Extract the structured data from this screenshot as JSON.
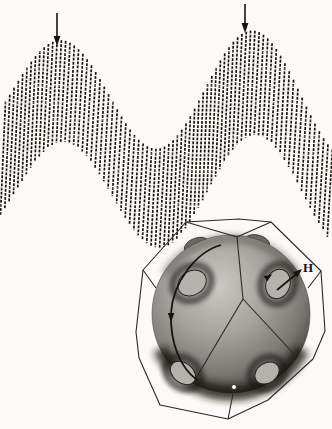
{
  "colors": {
    "background": "#fbfaf7",
    "ink": "#17130e",
    "wire": "#2b2926",
    "orbit": "#151310",
    "ball_core": "#cbc9c4",
    "ball_mid": "#9a9893",
    "ball_outer": "#4a4844",
    "ball_rim": "#17150f",
    "neck_fill": "#b4b2ad",
    "neck_halo": "#1b1916",
    "bump_fill": "#6e6c67"
  },
  "waveform": {
    "x_start": 3,
    "x_end": 330,
    "stroke_spacing": 4.3,
    "stroke_lean": 5,
    "stroke_width": 1.7,
    "dash": "2.8 1.3",
    "top_envelope": {
      "base": 92,
      "amp0": 49,
      "amp_slope": 0.05,
      "phase_x": 57,
      "period": 192
    },
    "bottom_envelope": {
      "base": 193,
      "amp0": 49,
      "amp_slope": 0.035,
      "phase_x": 65,
      "period": 192
    },
    "beat_peaks": [
      {
        "x": 57,
        "top_y": 43
      },
      {
        "x": 245,
        "top_y": 32
      }
    ],
    "beat_trough": {
      "x": 150,
      "top_y": 146
    },
    "marker_arrows": [
      {
        "x": 57,
        "y1": 13,
        "y2": 41
      },
      {
        "x": 245,
        "y1": 4,
        "y2": 28
      }
    ],
    "raster_lines": {
      "y_start": 52,
      "y_step": 17,
      "count": 10,
      "opacity": 0.45
    }
  },
  "brillouin_zone": {
    "outline": [
      [
        186,
        222
      ],
      [
        239,
        219
      ],
      [
        271,
        222
      ],
      [
        321,
        271
      ],
      [
        325,
        331
      ],
      [
        313,
        359
      ],
      [
        268,
        400
      ],
      [
        228,
        419
      ],
      [
        160,
        405
      ],
      [
        139,
        358
      ],
      [
        136,
        332
      ],
      [
        143,
        270
      ]
    ],
    "front_edges": [
      [
        [
          186,
          222
        ],
        [
          237,
          237
        ]
      ],
      [
        [
          237,
          237
        ],
        [
          271,
          222
        ]
      ],
      [
        [
          237,
          237
        ],
        [
          243,
          299
        ]
      ],
      [
        [
          243,
          299
        ],
        [
          196,
          378
        ]
      ],
      [
        [
          243,
          299
        ],
        [
          293,
          353
        ]
      ],
      [
        [
          143,
          270
        ],
        [
          156,
          288
        ]
      ],
      [
        [
          321,
          271
        ],
        [
          308,
          288
        ]
      ],
      [
        [
          234,
          389
        ],
        [
          228,
          419
        ]
      ]
    ],
    "vertex_marker": {
      "cx": 234,
      "cy": 387,
      "r": 2.5
    }
  },
  "fermi_surface": {
    "ball": {
      "cx": 231,
      "cy": 314,
      "r": 79
    },
    "necks": [
      {
        "cx": 192,
        "cy": 283,
        "rx": 15,
        "ry": 12,
        "rot": -32
      },
      {
        "cx": 278,
        "cy": 284,
        "rx": 12,
        "ry": 15,
        "rot": 18
      },
      {
        "cx": 183,
        "cy": 373,
        "rx": 14,
        "ry": 10,
        "rot": 38
      },
      {
        "cx": 267,
        "cy": 373,
        "rx": 13,
        "ry": 10,
        "rot": -35
      }
    ],
    "silhouette_bumps": [
      {
        "cx": 197,
        "cy": 246,
        "rx": 13,
        "ry": 8,
        "rot": -18
      },
      {
        "cx": 257,
        "cy": 243,
        "rx": 13,
        "ry": 8,
        "rot": 14
      }
    ],
    "orbit_path": "M 221 245 C 196 252 173 282 171 313 C 170 345 181 368 197 380",
    "orbit_arrow": {
      "x": 171,
      "y": 316
    },
    "neck_orbit_arrow": {
      "x": 268,
      "y": 277,
      "angle": 235
    },
    "field_arrow": {
      "x1": 277,
      "y1": 290,
      "x2": 300,
      "y2": 271,
      "angle": -40.6
    },
    "field_label": {
      "text": "H",
      "x": 303,
      "y": 272
    }
  }
}
